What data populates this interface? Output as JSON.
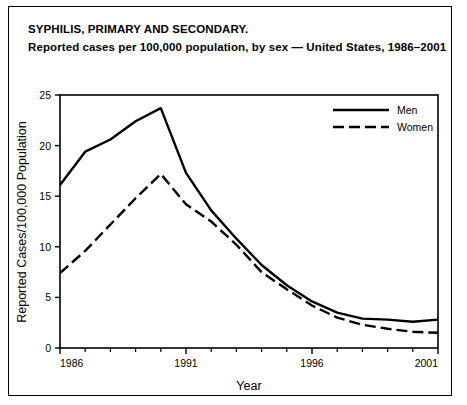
{
  "title": {
    "line1": "SYPHILIS, PRIMARY AND SECONDARY.",
    "line2": "Reported cases per 100,000 population, by sex — United States, 1986–2001"
  },
  "axes": {
    "xlabel": "Year",
    "ylabel": "Reported Cases/100,000 Population",
    "ytick_labels": [
      "0",
      "5",
      "10",
      "15",
      "20",
      "25"
    ],
    "xtick_labels": [
      "1986",
      "1991",
      "1996",
      "2001"
    ]
  },
  "legend": {
    "items": [
      {
        "label": "Men",
        "style": "solid"
      },
      {
        "label": "Women",
        "style": "dashed"
      }
    ]
  },
  "colors": {
    "line": "#000000",
    "background": "#ffffff",
    "border": "#000000"
  },
  "chart_data": {
    "type": "line",
    "title": "SYPHILIS, PRIMARY AND SECONDARY. Reported cases per 100,000 population, by sex — United States, 1986–2001",
    "xlabel": "Year",
    "ylabel": "Reported Cases/100,000 Population",
    "xlim": [
      1986,
      2001
    ],
    "ylim": [
      0,
      25
    ],
    "yticks": [
      0,
      5,
      10,
      15,
      20,
      25
    ],
    "xticks": [
      1986,
      1991,
      1996,
      2001
    ],
    "xtick_minor_every": 1,
    "grid": false,
    "legend_position": "top-right",
    "x": [
      1986,
      1987,
      1988,
      1989,
      1990,
      1991,
      1992,
      1993,
      1994,
      1995,
      1996,
      1997,
      1998,
      1999,
      2000,
      2001
    ],
    "series": [
      {
        "name": "Men",
        "style": "solid",
        "values": [
          16.1,
          19.4,
          20.6,
          22.4,
          23.7,
          17.3,
          13.6,
          10.8,
          8.2,
          6.2,
          4.6,
          3.5,
          2.9,
          2.8,
          2.6,
          2.8
        ]
      },
      {
        "name": "Women",
        "style": "dashed",
        "values": [
          7.4,
          9.6,
          12.2,
          14.8,
          17.2,
          14.2,
          12.5,
          10.2,
          7.5,
          5.8,
          4.2,
          3.0,
          2.3,
          1.9,
          1.6,
          1.5
        ]
      }
    ]
  }
}
